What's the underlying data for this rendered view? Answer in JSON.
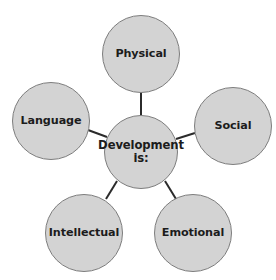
{
  "diagram": {
    "type": "radial-spoke-map",
    "background_color": "#ffffff",
    "node_fill_color": "#d3d3d3",
    "node_border_color": "#7d7d7d",
    "text_color": "#1c1c1c",
    "connector_color": "#2b2b2b",
    "center": {
      "label": "Development is:",
      "label_line_1": "Development",
      "label_line_2": "is:",
      "cx": 141,
      "cy": 152,
      "diameter": 74
    },
    "satellites": [
      {
        "id": "physical",
        "label": "Physical",
        "position": "top",
        "cx": 141,
        "cy": 54,
        "diameter": 78
      },
      {
        "id": "language",
        "label": "Language",
        "position": "upper-left",
        "cx": 51,
        "cy": 121,
        "diameter": 78
      },
      {
        "id": "social",
        "label": "Social",
        "position": "upper-right",
        "cx": 233,
        "cy": 126,
        "diameter": 78
      },
      {
        "id": "intellectual",
        "label": "Intellectual",
        "position": "lower-left",
        "cx": 84,
        "cy": 233,
        "diameter": 78
      },
      {
        "id": "emotional",
        "label": "Emotional",
        "position": "lower-right",
        "cx": 193,
        "cy": 233,
        "diameter": 78
      }
    ],
    "connectors": [
      {
        "id": "center-to-physical",
        "from": "center",
        "to": "physical",
        "x1": 141,
        "y1": 115,
        "x2": 141,
        "y2": 93
      },
      {
        "id": "center-to-language",
        "from": "center",
        "to": "language",
        "x1": 107,
        "y1": 137,
        "x2": 88,
        "y2": 130
      },
      {
        "id": "center-to-social",
        "from": "center",
        "to": "social",
        "x1": 176,
        "y1": 139,
        "x2": 195,
        "y2": 133
      },
      {
        "id": "center-to-intellectual",
        "from": "center",
        "to": "intellectual",
        "x1": 117,
        "y1": 181,
        "x2": 106,
        "y2": 199
      },
      {
        "id": "center-to-emotional",
        "from": "center",
        "to": "emotional",
        "x1": 165,
        "y1": 181,
        "x2": 176,
        "y2": 199
      }
    ]
  }
}
